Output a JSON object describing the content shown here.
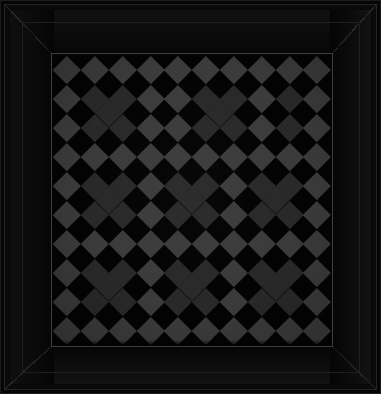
{
  "artwork": {
    "title": "Framed Diagonal Checkerboard Panel",
    "caption": "Dark beveled frame enclosing an argyle-style tiled panel"
  },
  "frame": {
    "name": "beveled-picture-frame",
    "corner_style": "mitered",
    "outer_color": "#0a0a0a",
    "face_color": "#0f0f0f",
    "bevel_highlight_color": "#242424",
    "groove_color": "#1e1e1e",
    "background_color": "#050505",
    "outer_rim_color": "#1b1b1b"
  },
  "panel": {
    "name": "tiled-panel",
    "rim_color": "#3e3e3e",
    "background_color": "#030303",
    "left": 53,
    "top": 55,
    "width": 278,
    "height": 290
  },
  "pattern": {
    "name": "diagonal-checkerboard",
    "type": "argyle-diamond-grid",
    "tile_pitch_px": 27.8,
    "columns": 10,
    "rows": 10,
    "tile_light_color": "#3b3b3b",
    "tile_dark_color": "#292929",
    "ground_color": "#030303",
    "block_grid": 3,
    "block_note": "Darker diamonds grouped into a 3 by 3 arrangement of larger blocks"
  },
  "chart_data": {
    "type": "heatmap",
    "title": "Framed Diagonal Checkerboard Panel",
    "xlabel": "",
    "ylabel": "",
    "grid": false,
    "legend": "none",
    "categories_x": [
      "1",
      "2",
      "3",
      "4",
      "5",
      "6",
      "7",
      "8",
      "9",
      "10"
    ],
    "categories_y": [
      "1",
      "2",
      "3",
      "4",
      "5",
      "6",
      "7",
      "8",
      "9",
      "10"
    ],
    "value_colors": {
      "0": "#030303",
      "1": "#3b3b3b",
      "2": "#292929"
    },
    "values": [
      [
        1,
        1,
        1,
        1,
        1,
        1,
        1,
        1,
        1,
        1
      ],
      [
        1,
        2,
        2,
        1,
        1,
        2,
        2,
        1,
        2,
        1
      ],
      [
        1,
        2,
        2,
        1,
        1,
        2,
        2,
        1,
        2,
        1
      ],
      [
        1,
        1,
        1,
        1,
        1,
        1,
        1,
        1,
        1,
        1
      ],
      [
        1,
        2,
        2,
        1,
        2,
        2,
        1,
        2,
        2,
        1
      ],
      [
        1,
        2,
        2,
        1,
        2,
        2,
        1,
        2,
        2,
        1
      ],
      [
        1,
        1,
        1,
        1,
        1,
        1,
        1,
        1,
        1,
        1
      ],
      [
        1,
        2,
        2,
        1,
        2,
        2,
        1,
        2,
        2,
        1
      ],
      [
        1,
        2,
        2,
        1,
        2,
        2,
        1,
        2,
        2,
        1
      ],
      [
        1,
        1,
        1,
        1,
        1,
        1,
        1,
        1,
        1,
        1
      ]
    ]
  }
}
